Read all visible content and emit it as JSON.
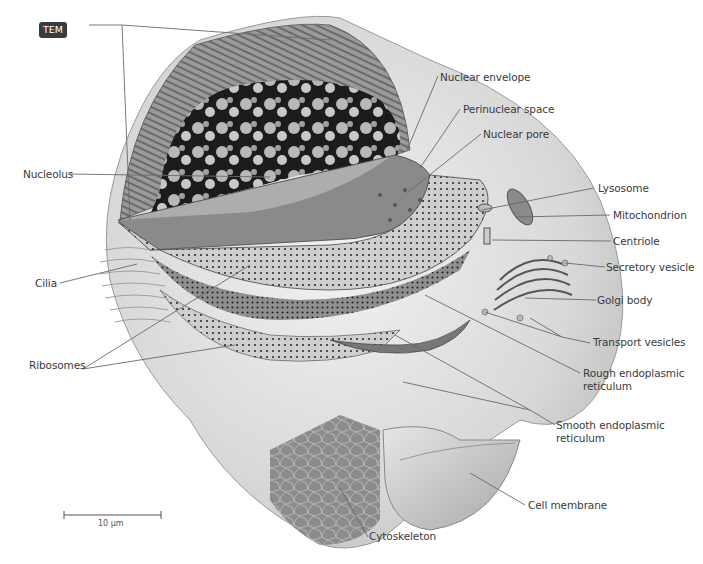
{
  "figure": {
    "tem_badge": "TEM",
    "scale_bar": {
      "label": "10 µm"
    }
  },
  "labels": {
    "nucleolus": "Nucleolus",
    "cilia": "Cilia",
    "ribosomes": "Ribosomes",
    "nuclear_envelope": "Nuclear envelope",
    "perinuclear_space": "Perinuclear space",
    "nuclear_pore": "Nuclear pore",
    "lysosome": "Lysosome",
    "mitochondrion": "Mitochondrion",
    "centriole": "Centriole",
    "secretory_vesicle": "Secretory vesicle",
    "golgi_body": "Golgi body",
    "transport_vesicles": "Transport vesicles",
    "rough_er_line1": "Rough endoplasmic",
    "rough_er_line2": "reticulum",
    "smooth_er_line1": "Smooth endoplasmic",
    "smooth_er_line2": "reticulum",
    "cell_membrane": "Cell membrane",
    "cytoskeleton": "Cytoskeleton"
  },
  "colors": {
    "leader_line": "#6a6a6a",
    "label_text": "#3a3a3a",
    "badge_bg": "#3b3b3b",
    "cell_fill": "#dcdcdc",
    "nucleus_dark": "#1c1c1c"
  }
}
